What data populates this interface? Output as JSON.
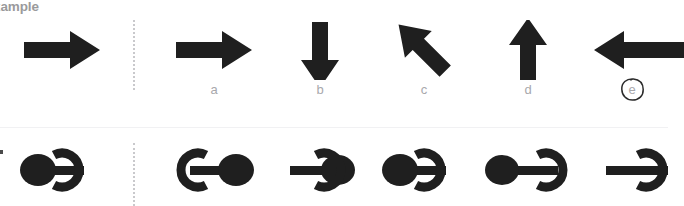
{
  "heading": {
    "text": "xample",
    "color": "#9a9a9c"
  },
  "colors": {
    "ink": "#1f1f1f",
    "label": "#a8a8ac",
    "divider": "#c9c9cc",
    "rule": "#f1f1f3",
    "annotation": "#2b2b2b",
    "background": "#ffffff"
  },
  "rows": [
    {
      "name": "arrows-row",
      "reference": {
        "icon": "arrow-right-icon",
        "direction": "right",
        "label": ""
      },
      "options": [
        {
          "label": "a",
          "icon": "arrow-right-icon",
          "direction": "right",
          "circled": false
        },
        {
          "label": "b",
          "icon": "arrow-down-icon",
          "direction": "down",
          "circled": false
        },
        {
          "label": "c",
          "icon": "arrow-down-left-icon",
          "direction": "down-left",
          "circled": false
        },
        {
          "label": "d",
          "icon": "arrow-up-icon",
          "direction": "up",
          "circled": false
        },
        {
          "label": "e",
          "icon": "arrow-left-icon",
          "direction": "left",
          "circled": true
        }
      ]
    },
    {
      "name": "symbols-row",
      "reference": {
        "icon": "ellipse-bar-ring-icon",
        "ellipse_side": "left",
        "ring_opening": "right",
        "label": ""
      },
      "options": [
        {
          "label": "",
          "icon": "ellipse-bar-ring-icon",
          "ellipse_side": "right",
          "ring_opening": "right",
          "circled": false
        },
        {
          "label": "",
          "icon": "ellipse-bar-ring-icon",
          "ellipse_side": "right",
          "ring_opening": "right",
          "variant": "ring-left",
          "circled": false
        },
        {
          "label": "",
          "icon": "ellipse-bar-ring-icon",
          "ellipse_side": "left",
          "ring_opening": "right",
          "circled": false
        },
        {
          "label": "",
          "icon": "ellipse-bar-ring-icon",
          "ellipse_side": "left",
          "ring_opening": "right",
          "variant": "ring-right",
          "circled": false
        },
        {
          "label": "",
          "icon": "ring-bar-icon",
          "ellipse_side": "clipped",
          "ring_opening": "right",
          "circled": false
        }
      ]
    }
  ]
}
